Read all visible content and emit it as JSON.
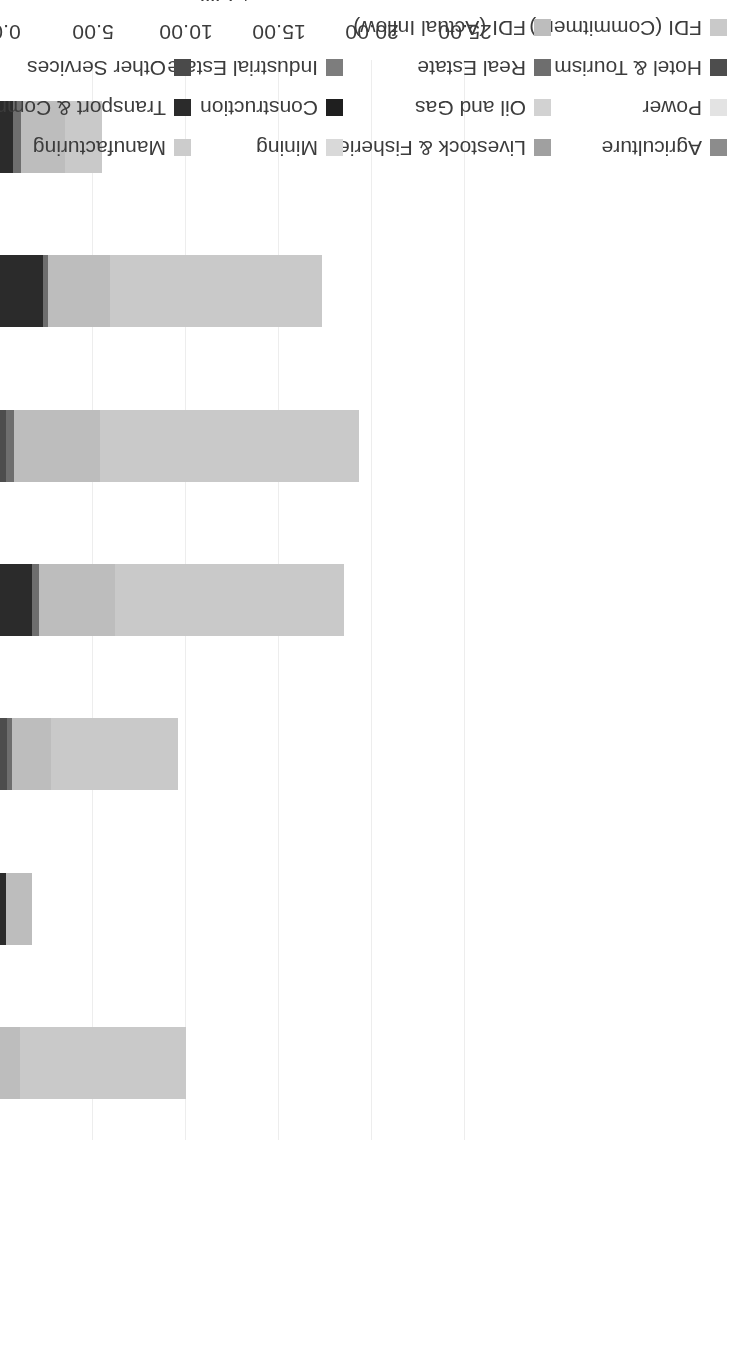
{
  "chart_data": {
    "type": "bar",
    "orientation": "vertical-stacked",
    "title": "",
    "subtitle": "",
    "xlabel": "",
    "ylabel": "US $ billion",
    "ylim": [
      0,
      25
    ],
    "ytick_labels": [
      "0.00",
      "5.00",
      "10.00",
      "15.00",
      "20.00",
      "25.00"
    ],
    "ytick_values": [
      0,
      5,
      10,
      15,
      20,
      25
    ],
    "grid": true,
    "legend_position": "bottom",
    "categories": [
      "2011/12",
      "2012/13",
      "2013/14",
      "2014/15",
      "2015/16",
      "2016/17",
      "2017/18 (From April to October)"
    ],
    "category_lines": [
      [
        "2011/12"
      ],
      [
        "2012/13"
      ],
      [
        "2013/14"
      ],
      [
        "2014/15"
      ],
      [
        "2015/16"
      ],
      [
        "2016/17"
      ],
      [
        "2017/18 (From",
        "April to October)"
      ]
    ],
    "series": [
      {
        "name": "Agriculture",
        "color": "#8c8c8c",
        "values": [
          0.0,
          0.0,
          0.0,
          0.0,
          0.0,
          0.0,
          0.0
        ]
      },
      {
        "name": "Livestock & Fisheries",
        "color": "#a0a0a0",
        "values": [
          0.0,
          0.0,
          0.0,
          0.0,
          0.0,
          0.0,
          0.0
        ]
      },
      {
        "name": "Mining",
        "color": "#d9d9d9",
        "values": [
          0.0,
          0.0,
          0.0,
          0.0,
          0.0,
          0.0,
          0.0
        ]
      },
      {
        "name": "Manufacturing",
        "color": "#cccccc",
        "values": [
          0.0,
          0.0,
          0.0,
          0.0,
          0.0,
          0.0,
          0.0
        ]
      },
      {
        "name": "Power",
        "color": "#e3e3e3",
        "values": [
          0.0,
          0.0,
          0.0,
          0.0,
          0.0,
          0.0,
          0.0
        ]
      },
      {
        "name": "Oil and  Gas",
        "color": "#d2d2d2",
        "values": [
          0.0,
          0.0,
          0.0,
          0.0,
          0.0,
          0.0,
          0.0
        ]
      },
      {
        "name": "Construction",
        "color": "#1f1f1f",
        "values": [
          0.0,
          0.0,
          0.0,
          0.0,
          0.0,
          0.0,
          0.0
        ]
      },
      {
        "name": "Transport & Communication",
        "color": "#2b2b2b",
        "values": [
          0.0,
          0.3,
          0.0,
          1.7,
          0.0,
          2.3,
          0.7
        ]
      },
      {
        "name": "Hotel  &  Tourism",
        "color": "#4d4d4d",
        "values": [
          0.0,
          0.0,
          0.4,
          0.0,
          0.3,
          0.0,
          0.0
        ]
      },
      {
        "name": "Real Estate",
        "color": "#6e6e6e",
        "values": [
          0.0,
          0.0,
          0.25,
          0.4,
          0.45,
          0.3,
          0.45
        ]
      },
      {
        "name": "Industrial Estate",
        "color": "#7d7d7d",
        "values": [
          0.0,
          0.0,
          0.0,
          0.0,
          0.0,
          0.0,
          0.0
        ]
      },
      {
        "name": "Other Services",
        "color": "#4a4a4a",
        "values": [
          0.0,
          0.0,
          0.0,
          0.0,
          0.0,
          0.0,
          0.0
        ]
      },
      {
        "name": "FDI (Actual Inflow)",
        "color": "#bdbdbd",
        "values": [
          1.1,
          1.4,
          2.1,
          4.1,
          4.6,
          3.3,
          2.35
        ]
      },
      {
        "name": "FDI (Commitment)",
        "color": "#c9c9c9",
        "values": [
          8.9,
          0.0,
          6.8,
          12.3,
          13.95,
          11.4,
          2.0
        ]
      }
    ],
    "bar_totals": [
      10.0,
      1.7,
      9.55,
      18.5,
      19.3,
      17.3,
      5.5
    ],
    "legend_columns": [
      [
        "Agriculture",
        "Power",
        "Hotel  &  Tourism",
        "FDI (Commitment)"
      ],
      [
        "Livestock & Fisheries",
        "Oil and  Gas",
        "Real Estate",
        "FDI (Actual Inflow)"
      ],
      [
        "Mining",
        "Construction",
        "Industrial Estate"
      ],
      [
        "Manufacturing",
        "Transport & Communication",
        "Other Services"
      ]
    ],
    "legend_colors": {
      "Agriculture": "#8c8c8c",
      "Power": "#e3e3e3",
      "Hotel  &  Tourism": "#4d4d4d",
      "FDI (Commitment)": "#c9c9c9",
      "Livestock & Fisheries": "#a0a0a0",
      "Oil and  Gas": "#d2d2d2",
      "Real Estate": "#6e6e6e",
      "FDI (Actual Inflow)": "#bdbdbd",
      "Mining": "#d9d9d9",
      "Construction": "#1f1f1f",
      "Industrial Estate": "#7d7d7d",
      "Manufacturing": "#cccccc",
      "Transport & Communication": "#2b2b2b",
      "Other Services": "#4a4a4a"
    }
  },
  "axis": {
    "value_axis_title": "US $ billion",
    "tick_labels": [
      "25.00",
      "20.00",
      "15.00",
      "10.00",
      "5.00",
      "0.00"
    ]
  }
}
